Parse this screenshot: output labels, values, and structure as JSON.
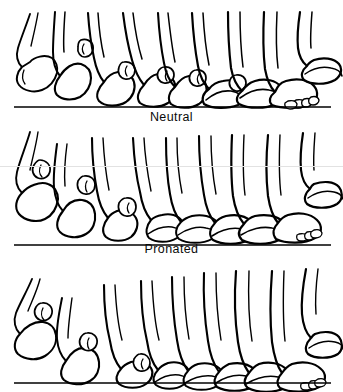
{
  "figure": {
    "background_color": "#ffffff",
    "ink_color": "#000000",
    "width": 343,
    "height": 392
  },
  "panels": [
    {
      "id": "neutral",
      "label": "Neutral",
      "label_visible": true,
      "ground_line_y": 107,
      "frame_count": 9,
      "description": "Lateral view sequence of nine foot positions across one gait cycle, neutral alignment",
      "frames": [
        {
          "index": 1,
          "phase": "swing / toe-off clearance",
          "x": 30,
          "ground_contact": false
        },
        {
          "index": 2,
          "phase": "terminal swing",
          "x": 68,
          "ground_contact": false
        },
        {
          "index": 3,
          "phase": "heel strike",
          "x": 103,
          "ground_contact": true
        },
        {
          "index": 4,
          "phase": "loading response",
          "x": 135,
          "ground_contact": true
        },
        {
          "index": 5,
          "phase": "midstance",
          "x": 168,
          "ground_contact": true
        },
        {
          "index": 6,
          "phase": "terminal stance",
          "x": 202,
          "ground_contact": true
        },
        {
          "index": 7,
          "phase": "heel rise",
          "x": 235,
          "ground_contact": true
        },
        {
          "index": 8,
          "phase": "pre-swing / toe-off",
          "x": 272,
          "ground_contact": true
        },
        {
          "index": 9,
          "phase": "initial swing",
          "x": 312,
          "ground_contact": false
        }
      ]
    },
    {
      "id": "pronated",
      "label": "Pronated",
      "label_visible": true,
      "ground_line_y": 245,
      "frame_count": 9,
      "description": "Lateral view sequence of nine foot positions across one gait cycle, pronated alignment",
      "frames": [
        {
          "index": 1,
          "phase": "swing / toe-off clearance",
          "x": 30,
          "ground_contact": false
        },
        {
          "index": 2,
          "phase": "terminal swing",
          "x": 70,
          "ground_contact": false
        },
        {
          "index": 3,
          "phase": "heel strike",
          "x": 108,
          "ground_contact": true
        },
        {
          "index": 4,
          "phase": "loading response",
          "x": 146,
          "ground_contact": true
        },
        {
          "index": 5,
          "phase": "midstance",
          "x": 178,
          "ground_contact": true
        },
        {
          "index": 6,
          "phase": "terminal stance",
          "x": 208,
          "ground_contact": true
        },
        {
          "index": 7,
          "phase": "heel rise",
          "x": 240,
          "ground_contact": true
        },
        {
          "index": 8,
          "phase": "pre-swing / toe-off",
          "x": 276,
          "ground_contact": true
        },
        {
          "index": 9,
          "phase": "initial swing",
          "x": 314,
          "ground_contact": false
        }
      ]
    },
    {
      "id": "third",
      "label": "",
      "label_visible": false,
      "ground_line_y": 122,
      "frame_count": 9,
      "description": "Third lateral view sequence of nine foot positions; caption cropped off below image edge",
      "frames": [
        {
          "index": 1,
          "phase": "swing / toe-off clearance",
          "x": 28,
          "ground_contact": false
        },
        {
          "index": 2,
          "phase": "terminal swing",
          "x": 75,
          "ground_contact": false
        },
        {
          "index": 3,
          "phase": "heel strike",
          "x": 118,
          "ground_contact": true
        },
        {
          "index": 4,
          "phase": "loading response",
          "x": 152,
          "ground_contact": true
        },
        {
          "index": 5,
          "phase": "midstance",
          "x": 182,
          "ground_contact": true
        },
        {
          "index": 6,
          "phase": "terminal stance",
          "x": 214,
          "ground_contact": true
        },
        {
          "index": 7,
          "phase": "heel rise",
          "x": 246,
          "ground_contact": true
        },
        {
          "index": 8,
          "phase": "pre-swing / toe-off",
          "x": 280,
          "ground_contact": true
        },
        {
          "index": 9,
          "phase": "initial swing",
          "x": 316,
          "ground_contact": false
        }
      ]
    }
  ],
  "artifacts": {
    "scan_line_y": 166,
    "scan_line_color": "#e2e2e2"
  }
}
